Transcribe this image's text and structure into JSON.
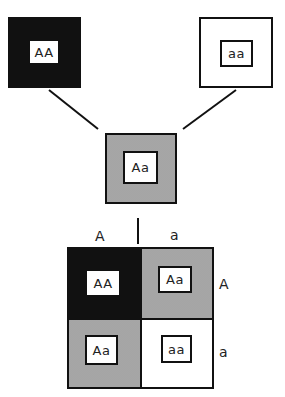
{
  "parents": [
    {
      "genotype": "AA",
      "fill": "black",
      "color": "#111111"
    },
    {
      "genotype": "aa",
      "fill": "white",
      "color": "#ffffff"
    }
  ],
  "offspring": {
    "genotype": "Aa",
    "fill": "stippled",
    "color": "#d9d9d9"
  },
  "punnett_square": {
    "column_alleles": [
      "A",
      "a"
    ],
    "row_alleles": [
      "A",
      "a"
    ],
    "cells": [
      [
        {
          "genotype": "AA",
          "fill": "black"
        },
        {
          "genotype": "Aa",
          "fill": "stippled"
        }
      ],
      [
        {
          "genotype": "Aa",
          "fill": "stippled"
        },
        {
          "genotype": "aa",
          "fill": "white"
        }
      ]
    ]
  }
}
